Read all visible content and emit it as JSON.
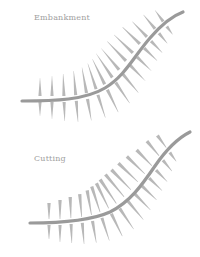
{
  "panels": [
    {
      "id": "embankment",
      "label": "Embankment",
      "label_pos": [
        34,
        18
      ],
      "road_path": "M22,101 C55,101 85,100 105,88 C125,76 135,55 150,38 C162,24 172,16 183,12",
      "wedge_thick_end": "road",
      "hachures": [
        {
          "t": [
            40,
            99
          ],
          "up": 18,
          "down": 14,
          "ang": 90
        },
        {
          "t": [
            52,
            99
          ],
          "up": 20,
          "down": 17,
          "ang": 90
        },
        {
          "t": [
            64,
            99
          ],
          "up": 22,
          "down": 19,
          "ang": 92
        },
        {
          "t": [
            76,
            98
          ],
          "up": 24,
          "down": 21,
          "ang": 95
        },
        {
          "t": [
            87,
            96
          ],
          "up": 26,
          "down": 22,
          "ang": 100
        },
        {
          "t": [
            97,
            92
          ],
          "up": 27,
          "down": 24,
          "ang": 108
        },
        {
          "t": [
            106,
            87
          ],
          "up": 28,
          "down": 25,
          "ang": 116
        },
        {
          "t": [
            114,
            80
          ],
          "up": 29,
          "down": 25,
          "ang": 124
        },
        {
          "t": [
            121,
            72
          ],
          "up": 28,
          "down": 24,
          "ang": 130
        },
        {
          "t": [
            128,
            63
          ],
          "up": 27,
          "down": 22,
          "ang": 134
        },
        {
          "t": [
            135,
            55
          ],
          "up": 26,
          "down": 20,
          "ang": 136
        },
        {
          "t": [
            142,
            46
          ],
          "up": 24,
          "down": 18,
          "ang": 136
        },
        {
          "t": [
            149,
            39
          ],
          "up": 21,
          "down": 16,
          "ang": 134
        },
        {
          "t": [
            157,
            31
          ],
          "up": 18,
          "down": 13,
          "ang": 130
        },
        {
          "t": [
            165,
            24
          ],
          "up": 14,
          "down": 10,
          "ang": 126
        }
      ]
    },
    {
      "id": "cutting",
      "label": "Cutting",
      "label_pos": [
        34,
        158
      ],
      "road_path": "M30,223 C60,223 90,221 110,212 C130,202 142,185 155,166 C166,150 176,139 190,132",
      "wedge_thick_end": "outer",
      "hachures": [
        {
          "t": [
            49,
            222
          ],
          "up": 16,
          "down": 14,
          "ang": 90
        },
        {
          "t": [
            60,
            222
          ],
          "up": 19,
          "down": 17,
          "ang": 90
        },
        {
          "t": [
            71,
            221
          ],
          "up": 21,
          "down": 19,
          "ang": 92
        },
        {
          "t": [
            82,
            220
          ],
          "up": 23,
          "down": 21,
          "ang": 95
        },
        {
          "t": [
            92,
            218
          ],
          "up": 25,
          "down": 22,
          "ang": 100
        },
        {
          "t": [
            101,
            215
          ],
          "up": 27,
          "down": 24,
          "ang": 108
        },
        {
          "t": [
            110,
            211
          ],
          "up": 28,
          "down": 25,
          "ang": 116
        },
        {
          "t": [
            118,
            206
          ],
          "up": 29,
          "down": 25,
          "ang": 124
        },
        {
          "t": [
            126,
            199
          ],
          "up": 29,
          "down": 24,
          "ang": 130
        },
        {
          "t": [
            133,
            192
          ],
          "up": 28,
          "down": 22,
          "ang": 134
        },
        {
          "t": [
            140,
            184
          ],
          "up": 27,
          "down": 20,
          "ang": 136
        },
        {
          "t": [
            147,
            176
          ],
          "up": 25,
          "down": 18,
          "ang": 136
        },
        {
          "t": [
            154,
            168
          ],
          "up": 22,
          "down": 16,
          "ang": 134
        },
        {
          "t": [
            161,
            158
          ],
          "up": 19,
          "down": 14,
          "ang": 130
        },
        {
          "t": [
            168,
            150
          ],
          "up": 15,
          "down": 11,
          "ang": 126
        }
      ]
    }
  ],
  "colors": {
    "road": "#9a9a9a",
    "hachure": "#b8b8b8",
    "label": "#a0a0a0",
    "background": "#ffffff"
  }
}
